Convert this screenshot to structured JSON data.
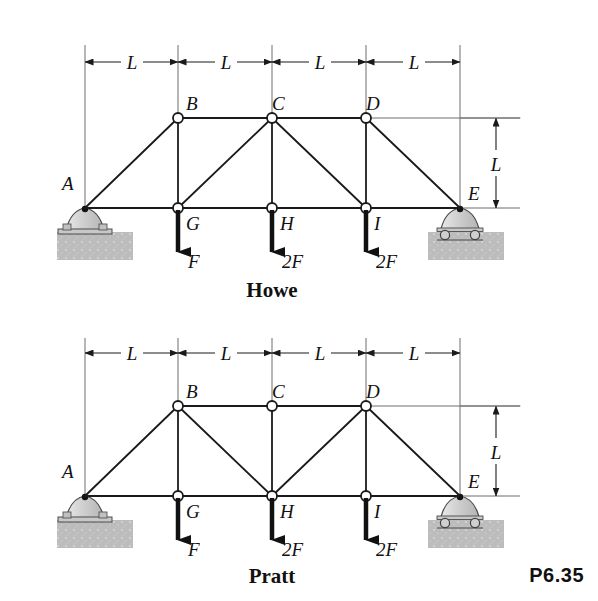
{
  "figure": {
    "problem_label": "P6.35",
    "trusses": [
      {
        "name": "howe",
        "caption": "Howe",
        "joint_labels": {
          "A": "A",
          "B": "B",
          "C": "C",
          "D": "D",
          "E": "E",
          "G": "G",
          "H": "H",
          "I": "I"
        },
        "span_dimension_labels": [
          "L",
          "L",
          "L",
          "L"
        ],
        "height_dimension_label": "L",
        "loads": [
          {
            "joint": "G",
            "label": "F"
          },
          {
            "joint": "H",
            "label": "2F"
          },
          {
            "joint": "I",
            "label": "2F"
          }
        ],
        "supports": [
          {
            "joint": "A",
            "type": "pin"
          },
          {
            "joint": "E",
            "type": "roller"
          }
        ],
        "members": [
          "A-B",
          "B-C",
          "C-D",
          "D-E",
          "A-G",
          "G-H",
          "H-I",
          "I-E",
          "B-G",
          "C-H",
          "D-I",
          "G-C",
          "C-I"
        ]
      },
      {
        "name": "pratt",
        "caption": "Pratt",
        "joint_labels": {
          "A": "A",
          "B": "B",
          "C": "C",
          "D": "D",
          "E": "E",
          "G": "G",
          "H": "H",
          "I": "I"
        },
        "span_dimension_labels": [
          "L",
          "L",
          "L",
          "L"
        ],
        "height_dimension_label": "L",
        "loads": [
          {
            "joint": "G",
            "label": "F"
          },
          {
            "joint": "H",
            "label": "2F"
          },
          {
            "joint": "I",
            "label": "2F"
          }
        ],
        "supports": [
          {
            "joint": "A",
            "type": "pin"
          },
          {
            "joint": "E",
            "type": "roller"
          }
        ],
        "members": [
          "A-B",
          "B-C",
          "C-D",
          "D-E",
          "A-G",
          "G-H",
          "H-I",
          "I-E",
          "B-G",
          "C-H",
          "D-I",
          "B-H",
          "H-D"
        ]
      }
    ],
    "colors": {
      "line": "#1a1a1a",
      "support_fill": "#cfcfcf",
      "ground_fill": "#bdbdbd",
      "background": "#ffffff"
    }
  }
}
